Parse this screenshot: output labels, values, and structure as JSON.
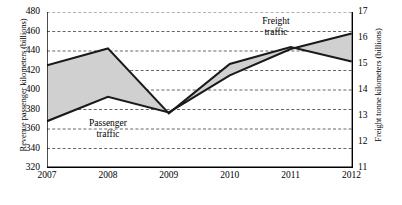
{
  "chart_data": {
    "type": "line",
    "title": "",
    "xlabel": "",
    "categories": [
      "2007",
      "2008",
      "2009",
      "2010",
      "2011",
      "2012"
    ],
    "x": [
      2007,
      2008,
      2009,
      2010,
      2011,
      2012
    ],
    "grid": true,
    "legend_position": "inline-annotations",
    "series": [
      {
        "name": "Passenger traffic",
        "axis": "left",
        "unit": "Revenue passenger kilometers (billions)",
        "values": [
          368,
          393,
          377,
          415,
          442,
          458
        ]
      },
      {
        "name": "Freight traffic",
        "axis": "right",
        "unit": "Freight tonne kilometers (billions)",
        "values": [
          14.95,
          15.6,
          13.1,
          15.0,
          15.65,
          15.1
        ]
      }
    ],
    "axes": {
      "left": {
        "label": "Revenue passenger kilometers (billions)",
        "ticks": [
          320,
          340,
          360,
          380,
          400,
          420,
          440,
          460,
          480
        ],
        "tick_labels": [
          "320",
          "340",
          "360",
          "380",
          "400",
          "420",
          "440",
          "460",
          "480"
        ],
        "ylim": [
          320,
          480
        ]
      },
      "right": {
        "label": "Freight tonne kilometers (billions)",
        "ticks": [
          11,
          12,
          13,
          14,
          15,
          16,
          17
        ],
        "tick_labels": [
          "11",
          "12",
          "13",
          "14",
          "15",
          "16",
          "17"
        ],
        "ylim": [
          11,
          17
        ]
      },
      "bottom": {
        "label": "",
        "tick_labels": [
          "2007",
          "2008",
          "2009",
          "2010",
          "2011",
          "2012"
        ]
      }
    },
    "annotations": [
      {
        "text_line1": "Passenger",
        "text_line2": "traffic"
      },
      {
        "text_line1": "Freight",
        "text_line2": "traffic"
      }
    ],
    "colors": {
      "line": "#1a1a1a",
      "fill": "#d0d0d0",
      "grid": "#555555",
      "axis": "#000000",
      "background": "#ffffff"
    }
  },
  "annotations": {
    "passenger": {
      "line1": "Passenger",
      "line2": "traffic"
    },
    "freight": {
      "line1": "Freight",
      "line2": "traffic"
    }
  },
  "caption": ""
}
